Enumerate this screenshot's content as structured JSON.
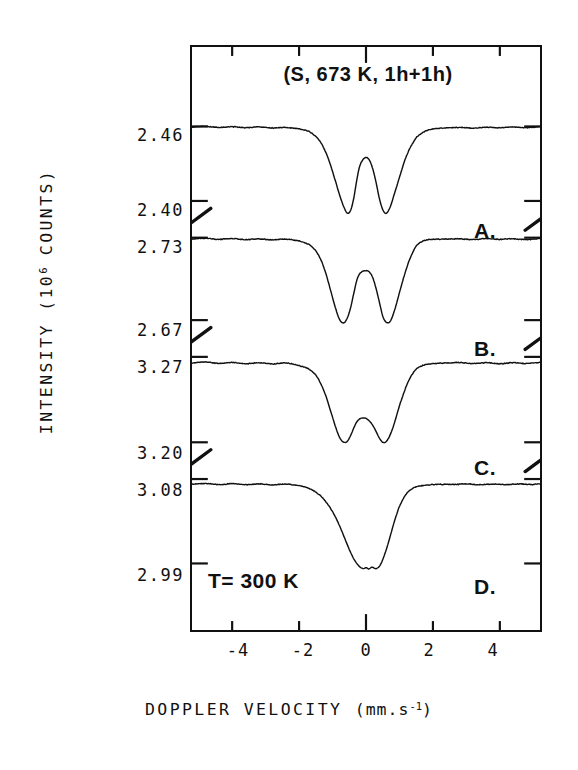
{
  "figure": {
    "plot_title": "(S, 673 K, 1h+1h)",
    "temperature_note": "T= 300 K",
    "y_axis_title": "INTENSITY (10",
    "y_axis_title_sup": "6",
    "y_axis_title_tail": " COUNTS)",
    "x_axis_title": "DOPPLER VELOCITY ",
    "x_axis_unit_open": "(mm.s",
    "x_axis_unit_sup": "-1",
    "x_axis_unit_close": ")"
  },
  "panels": [
    {
      "tag": "A.",
      "y_top_label": "2.46",
      "y_bottom_label": "2.40"
    },
    {
      "tag": "B.",
      "y_top_label": "2.73",
      "y_bottom_label": "2.67"
    },
    {
      "tag": "C.",
      "y_top_label": "3.27",
      "y_bottom_label": "3.20"
    },
    {
      "tag": "D.",
      "y_top_label": "3.08",
      "y_bottom_label": "2.99"
    }
  ],
  "x_ticks": [
    {
      "label": "-4",
      "value": -4
    },
    {
      "label": "-2",
      "value": -2
    },
    {
      "label": "0",
      "value": 0
    },
    {
      "label": "2",
      "value": 2
    },
    {
      "label": "4",
      "value": 4
    }
  ],
  "colors": {
    "ink": "#111111",
    "paper": "#ffffff"
  },
  "chart_data": {
    "type": "line",
    "title": "(S, 673 K, 1h+1h)",
    "xlabel": "DOPPLER VELOCITY (mm.s-1)",
    "ylabel": "INTENSITY (10^6 COUNTS)",
    "xlim": [
      -5.2,
      5.2
    ],
    "xtick_values": [
      -4,
      -2,
      0,
      2,
      4
    ],
    "grid": false,
    "legend_position": "none",
    "annotations": [
      "(S, 673 K, 1h+1h)",
      "T= 300 K",
      "A.",
      "B.",
      "C.",
      "D."
    ],
    "note": "Four stacked Mossbauer absorption spectra (A-D) recorded at 300 K; each sub-panel has its own broken intensity axis.",
    "series": [
      {
        "name": "A.",
        "ylim": [
          2.4,
          2.46
        ],
        "ytick_values": [
          2.4,
          2.46
        ],
        "x": [
          -5.2,
          -4.8,
          -4.4,
          -4.0,
          -3.6,
          -3.2,
          -2.8,
          -2.4,
          -2.0,
          -1.7,
          -1.5,
          -1.35,
          -1.2,
          -1.05,
          -0.9,
          -0.78,
          -0.66,
          -0.55,
          -0.45,
          -0.36,
          -0.28,
          -0.2,
          -0.1,
          0.0,
          0.1,
          0.2,
          0.3,
          0.4,
          0.5,
          0.6,
          0.72,
          0.85,
          1.0,
          1.15,
          1.3,
          1.5,
          1.75,
          2.0,
          2.4,
          2.8,
          3.2,
          3.6,
          4.0,
          4.4,
          4.8,
          5.2
        ],
        "y": [
          2.4595,
          2.46,
          2.4592,
          2.4598,
          2.459,
          2.4596,
          2.4588,
          2.4592,
          2.458,
          2.456,
          2.452,
          2.447,
          2.439,
          2.428,
          2.415,
          2.404,
          2.395,
          2.39,
          2.393,
          2.403,
          2.416,
          2.427,
          2.433,
          2.435,
          2.433,
          2.426,
          2.415,
          2.402,
          2.393,
          2.39,
          2.395,
          2.406,
          2.419,
          2.432,
          2.442,
          2.451,
          2.456,
          2.458,
          2.4588,
          2.4592,
          2.4586,
          2.4594,
          2.459,
          2.4596,
          2.459,
          2.4598
        ]
      },
      {
        "name": "B.",
        "ylim": [
          2.67,
          2.73
        ],
        "ytick_values": [
          2.67,
          2.73
        ],
        "x": [
          -5.2,
          -4.8,
          -4.4,
          -4.0,
          -3.6,
          -3.2,
          -2.8,
          -2.4,
          -2.0,
          -1.7,
          -1.5,
          -1.35,
          -1.2,
          -1.05,
          -0.9,
          -0.78,
          -0.66,
          -0.55,
          -0.45,
          -0.36,
          -0.28,
          -0.2,
          -0.1,
          0.0,
          0.1,
          0.2,
          0.3,
          0.4,
          0.5,
          0.6,
          0.72,
          0.85,
          1.0,
          1.15,
          1.3,
          1.5,
          1.75,
          2.0,
          2.4,
          2.8,
          3.2,
          3.6,
          4.0,
          4.4,
          4.8,
          5.2
        ],
        "y": [
          2.729,
          2.7296,
          2.7288,
          2.7294,
          2.7286,
          2.7292,
          2.7284,
          2.729,
          2.7276,
          2.725,
          2.7205,
          2.714,
          2.704,
          2.691,
          2.678,
          2.67,
          2.668,
          2.672,
          2.68,
          2.69,
          2.6985,
          2.7035,
          2.7055,
          2.706,
          2.705,
          2.701,
          2.693,
          2.683,
          2.673,
          2.6685,
          2.669,
          2.677,
          2.69,
          2.703,
          2.714,
          2.724,
          2.728,
          2.7288,
          2.729,
          2.7292,
          2.7286,
          2.7294,
          2.7288,
          2.7292,
          2.7286,
          2.7294
        ]
      },
      {
        "name": "C.",
        "ylim": [
          3.2,
          3.27
        ],
        "ytick_values": [
          3.2,
          3.27
        ],
        "x": [
          -5.2,
          -4.8,
          -4.4,
          -4.0,
          -3.6,
          -3.2,
          -2.8,
          -2.4,
          -2.0,
          -1.7,
          -1.5,
          -1.35,
          -1.2,
          -1.05,
          -0.9,
          -0.78,
          -0.66,
          -0.55,
          -0.45,
          -0.36,
          -0.28,
          -0.2,
          -0.1,
          0.0,
          0.1,
          0.2,
          0.3,
          0.4,
          0.5,
          0.6,
          0.72,
          0.85,
          1.0,
          1.15,
          1.3,
          1.5,
          1.75,
          2.0,
          2.4,
          2.8,
          3.2,
          3.6,
          4.0,
          4.4,
          4.8,
          5.2
        ],
        "y": [
          3.265,
          3.2658,
          3.2646,
          3.2654,
          3.2644,
          3.2652,
          3.2642,
          3.265,
          3.263,
          3.26,
          3.255,
          3.248,
          3.238,
          3.225,
          3.212,
          3.2035,
          3.2,
          3.201,
          3.206,
          3.212,
          3.2165,
          3.219,
          3.22,
          3.2195,
          3.2175,
          3.214,
          3.209,
          3.2035,
          3.2,
          3.2005,
          3.206,
          3.216,
          3.23,
          3.242,
          3.252,
          3.26,
          3.2635,
          3.2645,
          3.265,
          3.2654,
          3.2646,
          3.2652,
          3.2644,
          3.2652,
          3.2646,
          3.2654
        ]
      },
      {
        "name": "D.",
        "ylim": [
          2.99,
          3.08
        ],
        "ytick_values": [
          2.99,
          3.08
        ],
        "x": [
          -5.2,
          -4.8,
          -4.4,
          -4.0,
          -3.6,
          -3.2,
          -2.8,
          -2.4,
          -2.0,
          -1.7,
          -1.5,
          -1.3,
          -1.1,
          -0.95,
          -0.8,
          -0.65,
          -0.5,
          -0.35,
          -0.2,
          -0.08,
          0.0,
          0.08,
          0.18,
          0.3,
          0.42,
          0.55,
          0.7,
          0.85,
          1.0,
          1.2,
          1.4,
          1.6,
          1.9,
          2.2,
          2.6,
          3.0,
          3.4,
          3.8,
          4.2,
          4.6,
          5.0,
          5.2
        ],
        "y": [
          3.0745,
          3.0752,
          3.0742,
          3.075,
          3.074,
          3.0748,
          3.0738,
          3.0746,
          3.073,
          3.07,
          3.066,
          3.06,
          3.051,
          3.042,
          3.031,
          3.018,
          3.005,
          2.994,
          2.987,
          2.9845,
          2.9855,
          2.984,
          2.986,
          2.9845,
          2.988,
          2.999,
          3.016,
          3.035,
          3.051,
          3.064,
          3.07,
          3.0725,
          3.0738,
          3.0744,
          3.0742,
          3.0748,
          3.074,
          3.0746,
          3.074,
          3.0748,
          3.0742,
          3.075
        ]
      }
    ]
  }
}
